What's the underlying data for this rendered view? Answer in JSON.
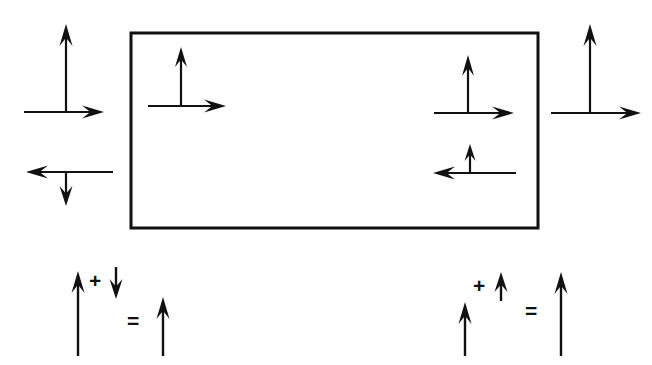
{
  "figure": {
    "background_color": "#ffffff",
    "ink_color": "#111111",
    "width": 652,
    "height": 365,
    "box": {
      "name": "rectangular-block",
      "x": 131,
      "y": 33,
      "width": 407,
      "height": 195,
      "stroke_width": 3,
      "fill": "#ffffff"
    },
    "arrows": [
      {
        "id": "outer-left-up",
        "label": "upward arrow outside left",
        "direction": "up",
        "x1": 66,
        "y1": 112,
        "x2": 66,
        "y2": 24,
        "shaft_width": 2.2,
        "head_length": 22,
        "head_width": 13
      },
      {
        "id": "outer-left-right",
        "label": "rightward arrow outside left",
        "direction": "right",
        "x1": 24,
        "y1": 112,
        "x2": 104,
        "y2": 112,
        "shaft_width": 2.2,
        "head_length": 22,
        "head_width": 13
      },
      {
        "id": "outer-left-left",
        "label": "leftward arrow outside left",
        "direction": "left",
        "x1": 113,
        "y1": 172,
        "x2": 26,
        "y2": 172,
        "shaft_width": 2.2,
        "head_length": 22,
        "head_width": 13
      },
      {
        "id": "outer-left-down",
        "label": "downward arrow outside left",
        "direction": "down",
        "x1": 66,
        "y1": 172,
        "x2": 66,
        "y2": 206,
        "shaft_width": 2.2,
        "head_length": 20,
        "head_width": 13
      },
      {
        "id": "inner-left-up",
        "label": "upward arrow inside block left",
        "direction": "up",
        "x1": 181,
        "y1": 106,
        "x2": 181,
        "y2": 47,
        "shaft_width": 2.2,
        "head_length": 20,
        "head_width": 12
      },
      {
        "id": "inner-left-right",
        "label": "rightward arrow inside block left",
        "direction": "right",
        "x1": 148,
        "y1": 106,
        "x2": 226,
        "y2": 106,
        "shaft_width": 2.2,
        "head_length": 22,
        "head_width": 13
      },
      {
        "id": "inner-right-up",
        "label": "upward arrow inside block right",
        "direction": "up",
        "x1": 468,
        "y1": 112,
        "x2": 468,
        "y2": 55,
        "shaft_width": 2.2,
        "head_length": 21,
        "head_width": 12
      },
      {
        "id": "inner-right-right",
        "label": "rightward arrow inside block right",
        "direction": "right",
        "x1": 434,
        "y1": 113,
        "x2": 514,
        "y2": 113,
        "shaft_width": 2.2,
        "head_length": 22,
        "head_width": 13
      },
      {
        "id": "inner-right-left",
        "label": "leftward arrow inside block lower right",
        "direction": "left",
        "x1": 516,
        "y1": 173,
        "x2": 433,
        "y2": 173,
        "shaft_width": 2.2,
        "head_length": 22,
        "head_width": 13
      },
      {
        "id": "inner-right-smallup",
        "label": "short upward arrow inside block lower right",
        "direction": "up",
        "x1": 470,
        "y1": 174,
        "x2": 470,
        "y2": 144,
        "shaft_width": 2.2,
        "head_length": 17,
        "head_width": 11
      },
      {
        "id": "outer-right-up",
        "label": "upward arrow outside right",
        "direction": "up",
        "x1": 590,
        "y1": 113,
        "x2": 590,
        "y2": 24,
        "shaft_width": 2.2,
        "head_length": 22,
        "head_width": 13
      },
      {
        "id": "outer-right-right",
        "label": "rightward arrow outside right",
        "direction": "right",
        "x1": 551,
        "y1": 113,
        "x2": 641,
        "y2": 113,
        "shaft_width": 2.2,
        "head_length": 22,
        "head_width": 13
      },
      {
        "id": "eq-left-operand-1",
        "label": "left equation first operand, long up arrow",
        "direction": "up",
        "x1": 78,
        "y1": 356,
        "x2": 78,
        "y2": 271,
        "shaft_width": 2.4,
        "head_length": 22,
        "head_width": 13
      },
      {
        "id": "eq-left-operand-2",
        "label": "left equation second operand, short down arrow",
        "direction": "down",
        "x1": 116,
        "y1": 267,
        "x2": 116,
        "y2": 299,
        "shaft_width": 2.4,
        "head_length": 20,
        "head_width": 13
      },
      {
        "id": "eq-left-result",
        "label": "left equation result, medium up arrow",
        "direction": "up",
        "x1": 163,
        "y1": 356,
        "x2": 163,
        "y2": 297,
        "shaft_width": 2.4,
        "head_length": 22,
        "head_width": 13
      },
      {
        "id": "eq-right-operand-1",
        "label": "right equation first operand, medium up arrow",
        "direction": "up",
        "x1": 465,
        "y1": 356,
        "x2": 465,
        "y2": 302,
        "shaft_width": 2.4,
        "head_length": 22,
        "head_width": 13
      },
      {
        "id": "eq-right-operand-2",
        "label": "right equation second operand, short up arrow",
        "direction": "up",
        "x1": 501,
        "y1": 301,
        "x2": 501,
        "y2": 272,
        "shaft_width": 2.4,
        "head_length": 20,
        "head_width": 13
      },
      {
        "id": "eq-right-result",
        "label": "right equation result, long up arrow",
        "direction": "up",
        "x1": 561,
        "y1": 356,
        "x2": 561,
        "y2": 272,
        "shaft_width": 2.4,
        "head_length": 22,
        "head_width": 13
      }
    ],
    "operators": [
      {
        "id": "eq-left-plus",
        "name": "plus-sign",
        "text": "+",
        "x": 89,
        "y": 270,
        "font_size": 21
      },
      {
        "id": "eq-left-equals",
        "name": "equals-sign",
        "text": "=",
        "x": 127,
        "y": 310,
        "font_size": 21
      },
      {
        "id": "eq-right-plus",
        "name": "plus-sign",
        "text": "+",
        "x": 473,
        "y": 275,
        "font_size": 21
      },
      {
        "id": "eq-right-equals",
        "name": "equals-sign",
        "text": "=",
        "x": 525,
        "y": 300,
        "font_size": 21
      }
    ]
  }
}
